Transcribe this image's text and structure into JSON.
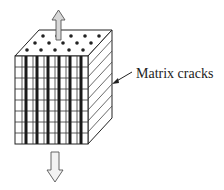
{
  "diagram": {
    "annotation_label": "Matrix cracks",
    "elements": [
      {
        "name": "laminate-cube",
        "description": "3D block with top face showing fiber ends (dots), front face grid with dark vertical crack bands, side face with diagonal hatching"
      },
      {
        "name": "tension-arrow-up",
        "direction": "up"
      },
      {
        "name": "tension-arrow-down",
        "direction": "down"
      }
    ],
    "colors": {
      "line": "#222222",
      "crack": "#1a1a1a",
      "arrow_fill": "#d8d8d8",
      "background": "#ffffff"
    }
  }
}
